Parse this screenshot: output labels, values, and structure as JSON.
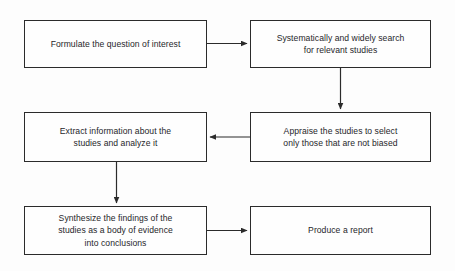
{
  "diagram": {
    "background_color": "#fdfdfd",
    "stroke_color": "#2b2b2b",
    "text_color": "#26262a",
    "nodes": [
      {
        "id": "formulate",
        "label": "Formulate the question of interest",
        "x": 24,
        "y": 20,
        "w": 183,
        "h": 48
      },
      {
        "id": "search",
        "label": "Systematically and widely search\nfor relevant studies",
        "x": 250,
        "y": 20,
        "w": 181,
        "h": 48
      },
      {
        "id": "appraise",
        "label": "Appraise the studies to select\nonly those that are not biased",
        "x": 250,
        "y": 112,
        "w": 181,
        "h": 50
      },
      {
        "id": "extract",
        "label": "Extract information about the\nstudies and analyze it",
        "x": 24,
        "y": 112,
        "w": 183,
        "h": 50
      },
      {
        "id": "synthesize",
        "label": "Synthesize the findings of the\nstudies as a body of evidence\ninto conclusions",
        "x": 24,
        "y": 206,
        "w": 183,
        "h": 49
      },
      {
        "id": "report",
        "label": "Produce a report",
        "x": 250,
        "y": 206,
        "w": 181,
        "h": 49
      }
    ],
    "edges": [
      {
        "id": "formulate-to-search",
        "from": "formulate",
        "to": "search",
        "direction": "right"
      },
      {
        "id": "search-to-appraise",
        "from": "search",
        "to": "appraise",
        "direction": "down"
      },
      {
        "id": "appraise-to-extract",
        "from": "appraise",
        "to": "extract",
        "direction": "left"
      },
      {
        "id": "extract-to-synthesize",
        "from": "extract",
        "to": "synthesize",
        "direction": "down"
      },
      {
        "id": "synthesize-to-report",
        "from": "synthesize",
        "to": "report",
        "direction": "right"
      }
    ]
  }
}
